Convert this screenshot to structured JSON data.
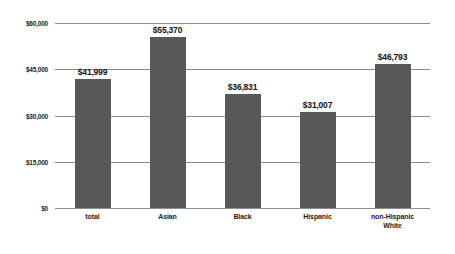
{
  "chart_data": {
    "type": "bar",
    "title": "",
    "xlabel": "",
    "ylabel": "",
    "categories": [
      "total",
      "Asian",
      "Black",
      "Hispanic",
      "non-Hispanic White"
    ],
    "category_lines": [
      [
        "total"
      ],
      [
        "Asian"
      ],
      [
        "Black"
      ],
      [
        "Hispanic"
      ],
      [
        "non-Hispanic",
        "White"
      ]
    ],
    "values": [
      41999,
      55370,
      36831,
      31007,
      46793
    ],
    "value_labels": [
      "$41,999",
      "$55,370",
      "$36,831",
      "$31,007",
      "$46,793"
    ],
    "ylim": [
      0,
      60000
    ],
    "ytick_values": [
      0,
      15000,
      30000,
      45000,
      60000
    ],
    "ytick_labels": [
      "$0",
      "$15,000",
      "$30,000",
      "$45,000",
      "$60,000"
    ],
    "grid": true,
    "legend": "none",
    "bar_color": "#58585a",
    "gridline_color": "#8d8d8d",
    "background_color": "#ffffff"
  }
}
